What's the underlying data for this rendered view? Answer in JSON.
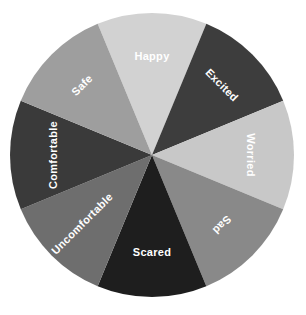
{
  "chart_data": {
    "type": "pie",
    "title": "",
    "subtitle": "",
    "xlabel": "",
    "ylabel": "",
    "legend_position": "none",
    "grid": false,
    "background_color": "#ffffff",
    "label_color": "#ffffff",
    "center_x": 152,
    "center_y": 155,
    "radius": 142,
    "start_angle_deg": -22.5,
    "categories": [
      "Happy",
      "Excited",
      "Worried",
      "Sad",
      "Scared",
      "Uncomfortable",
      "Comfortable",
      "Safe"
    ],
    "values": [
      12.5,
      12.5,
      12.5,
      12.5,
      12.5,
      12.5,
      12.5,
      12.5
    ],
    "colors": [
      "#d2d2d2",
      "#3d3d3d",
      "#c8c8c8",
      "#898989",
      "#1e1e1e",
      "#6e6e6e",
      "#3a3a3a",
      "#9e9e9e"
    ],
    "slices": [
      {
        "label": "Happy",
        "value": 12.5,
        "color": "#d2d2d2",
        "start_angle_deg": -22.5,
        "end_angle_deg": 22.5,
        "label_rotation_deg": 0,
        "label_radius": 98
      },
      {
        "label": "Excited",
        "value": 12.5,
        "color": "#3d3d3d",
        "start_angle_deg": 22.5,
        "end_angle_deg": 67.5,
        "label_rotation_deg": 45,
        "label_radius": 98
      },
      {
        "label": "Worried",
        "value": 12.5,
        "color": "#c8c8c8",
        "start_angle_deg": 67.5,
        "end_angle_deg": 112.5,
        "label_rotation_deg": 90,
        "label_radius": 98
      },
      {
        "label": "Sad",
        "value": 12.5,
        "color": "#898989",
        "start_angle_deg": 112.5,
        "end_angle_deg": 157.5,
        "label_rotation_deg": 135,
        "label_radius": 98
      },
      {
        "label": "Scared",
        "value": 12.5,
        "color": "#1e1e1e",
        "start_angle_deg": 157.5,
        "end_angle_deg": 202.5,
        "label_rotation_deg": 0,
        "label_radius": 98
      },
      {
        "label": "Uncomfortable",
        "value": 12.5,
        "color": "#6e6e6e",
        "start_angle_deg": 202.5,
        "end_angle_deg": 247.5,
        "label_rotation_deg": -45,
        "label_radius": 98
      },
      {
        "label": "Comfortable",
        "value": 12.5,
        "color": "#3a3a3a",
        "start_angle_deg": 247.5,
        "end_angle_deg": 292.5,
        "label_rotation_deg": -90,
        "label_radius": 98
      },
      {
        "label": "Safe",
        "value": 12.5,
        "color": "#9e9e9e",
        "start_angle_deg": 292.5,
        "end_angle_deg": 337.5,
        "label_rotation_deg": -45,
        "label_radius": 98
      }
    ]
  }
}
